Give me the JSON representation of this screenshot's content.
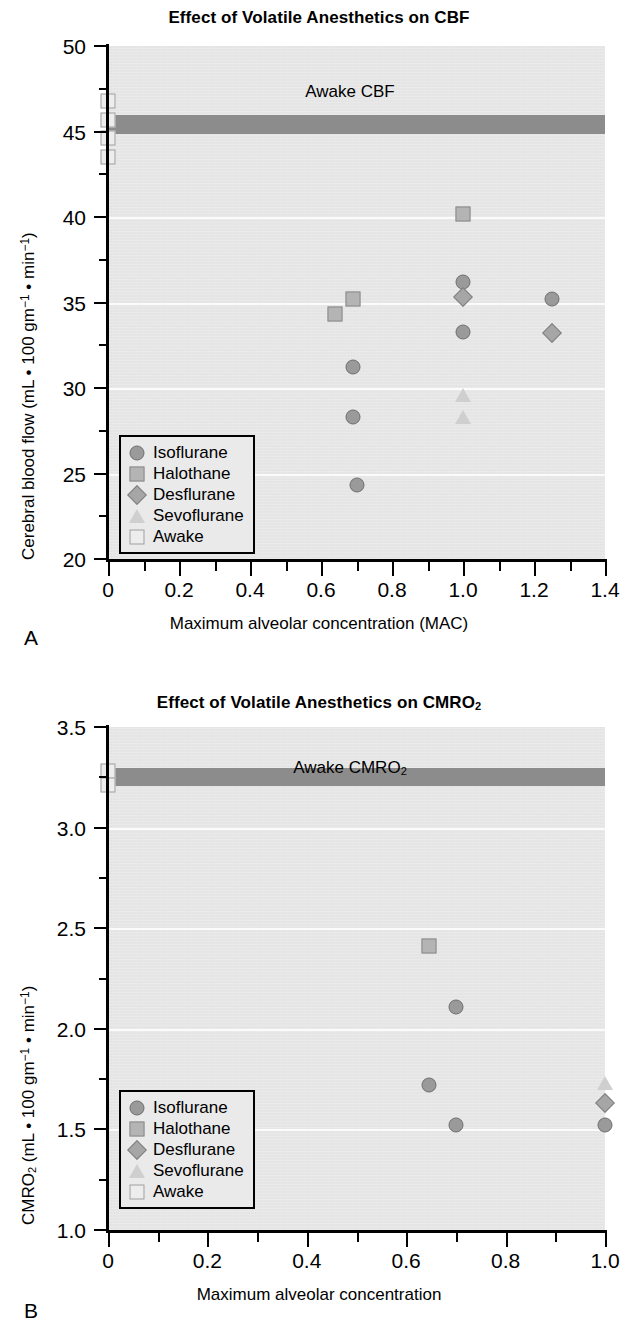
{
  "figure": {
    "panels": [
      {
        "letter": "A",
        "title_main": "Effect of Volatile Anesthetics on CBF",
        "title_plain": "Effect of Volatile Anesthetics on CBF",
        "band_label": "Awake CBF",
        "band_label_sub": ""
      },
      {
        "letter": "B",
        "title_main": "Effect of Volatile Anesthetics on CMRO",
        "title_sub": "2",
        "band_label": "Awake CMRO",
        "band_label_sub": "2"
      }
    ],
    "legend_items": [
      {
        "label": "Isoflurane",
        "symbol": "circle"
      },
      {
        "label": "Halothane",
        "symbol": "square"
      },
      {
        "label": "Desflurane",
        "symbol": "diamond"
      },
      {
        "label": "Sevoflurane",
        "symbol": "triangle"
      },
      {
        "label": "Awake",
        "symbol": "awake"
      }
    ],
    "colors": {
      "plot_background": "#e6e6e6",
      "awake_band": "#8c8c8c",
      "isoflurane": "#9a9a9a",
      "halothane": "#b4b4b4",
      "desflurane": "#a6a6a6",
      "sevoflurane": "#cfcfcf",
      "awake": "#ededed",
      "axis": "#000000",
      "gridline": "#fbfbfb"
    }
  },
  "chart_data": [
    {
      "type": "scatter",
      "panel": "A",
      "title": "Effect of Volatile Anesthetics on CBF",
      "xlabel": "Maximum alveolar concentration (MAC)",
      "ylabel": "Cerebral blood flow (mL • 100 gm⁻¹ • min⁻¹)",
      "ylabel_parts": {
        "lead": "Cerebral blood flow (mL • 100 gm",
        "sup1": "−1",
        "mid": " • min",
        "sup2": "−1",
        "tail": ")"
      },
      "xlim": [
        0,
        1.4
      ],
      "ylim": [
        20,
        50
      ],
      "xticks": [
        "0",
        "0.2",
        "0.4",
        "0.6",
        "0.8",
        "1.0",
        "1.2",
        "1.4"
      ],
      "xtick_values": [
        0,
        0.2,
        0.4,
        0.6,
        0.8,
        1.0,
        1.2,
        1.4
      ],
      "yticks": [
        "20",
        "25",
        "30",
        "35",
        "40",
        "45",
        "50"
      ],
      "ytick_values": [
        20,
        25,
        30,
        35,
        40,
        45,
        50
      ],
      "minor_ytick_values": [
        22.5,
        27.5,
        32.5,
        37.5,
        42.5,
        47.5
      ],
      "minor_xtick_values": [
        0.1,
        0.3,
        0.5,
        0.7,
        0.9,
        1.1,
        1.3
      ],
      "gridlines_y": [
        25,
        30,
        35,
        40,
        45
      ],
      "grid": true,
      "legend_position": "lower-left",
      "reference_band": {
        "label": "Awake CBF",
        "y_center": 45.4,
        "y_thickness": 1.1,
        "x_start": 0.0,
        "x_end": 1.4
      },
      "series": [
        {
          "name": "Isoflurane",
          "symbol": "circle",
          "points": [
            [
              0.69,
              31.2
            ],
            [
              0.69,
              28.3
            ],
            [
              0.7,
              24.3
            ],
            [
              1.0,
              36.2
            ],
            [
              1.0,
              33.3
            ],
            [
              1.25,
              35.2
            ]
          ]
        },
        {
          "name": "Halothane",
          "symbol": "square",
          "points": [
            [
              0.64,
              34.3
            ],
            [
              0.69,
              35.2
            ],
            [
              1.0,
              40.2
            ]
          ]
        },
        {
          "name": "Desflurane",
          "symbol": "diamond",
          "points": [
            [
              1.0,
              35.3
            ],
            [
              1.25,
              33.2
            ]
          ]
        },
        {
          "name": "Sevoflurane",
          "symbol": "triangle",
          "points": [
            [
              1.0,
              29.6
            ],
            [
              1.0,
              28.3
            ]
          ]
        },
        {
          "name": "Awake",
          "symbol": "awake",
          "points": [
            [
              0.0,
              46.8
            ],
            [
              0.0,
              45.7
            ],
            [
              0.0,
              44.6
            ],
            [
              0.0,
              43.5
            ]
          ]
        }
      ]
    },
    {
      "type": "scatter",
      "panel": "B",
      "title": "Effect of Volatile Anesthetics on CMRO2",
      "xlabel": "Maximum alveolar concentration",
      "ylabel": "CMRO2 (mL • 100 gm⁻¹ • min⁻¹)",
      "ylabel_parts": {
        "lead": "CMRO",
        "sub": "2",
        "mid1": " (mL • 100 gm",
        "sup1": "−1",
        "mid2": " • min",
        "sup2": "−1",
        "tail": ")"
      },
      "xlim": [
        0,
        1.0
      ],
      "ylim": [
        1.0,
        3.5
      ],
      "xticks": [
        "0",
        "0.2",
        "0.4",
        "0.6",
        "0.8",
        "1.0"
      ],
      "xtick_values": [
        0,
        0.2,
        0.4,
        0.6,
        0.8,
        1.0
      ],
      "yticks": [
        "1.0",
        "1.5",
        "2.0",
        "2.5",
        "3.0",
        "3.5"
      ],
      "ytick_values": [
        1.0,
        1.5,
        2.0,
        2.5,
        3.0,
        3.5
      ],
      "minor_ytick_values": [
        1.25,
        1.75,
        2.25,
        2.75,
        3.25
      ],
      "minor_xtick_values": [
        0.1,
        0.3,
        0.5,
        0.7,
        0.9
      ],
      "gridlines_y": [
        1.5,
        2.0,
        2.5,
        3.0
      ],
      "grid": true,
      "legend_position": "lower-left",
      "reference_band": {
        "label": "Awake CMRO2",
        "y_center": 3.25,
        "y_thickness": 0.09,
        "x_start": 0.0,
        "x_end": 1.0
      },
      "series": [
        {
          "name": "Isoflurane",
          "symbol": "circle",
          "points": [
            [
              0.645,
              1.72
            ],
            [
              0.7,
              2.11
            ],
            [
              0.7,
              1.52
            ],
            [
              1.0,
              1.52
            ]
          ]
        },
        {
          "name": "Halothane",
          "symbol": "square",
          "points": [
            [
              0.645,
              2.41
            ]
          ]
        },
        {
          "name": "Desflurane",
          "symbol": "diamond",
          "points": [
            [
              1.0,
              1.63
            ]
          ]
        },
        {
          "name": "Sevoflurane",
          "symbol": "triangle",
          "points": [
            [
              1.0,
              1.73
            ]
          ]
        },
        {
          "name": "Awake",
          "symbol": "awake",
          "points": [
            [
              0.0,
              3.28
            ],
            [
              0.0,
              3.21
            ]
          ]
        }
      ]
    }
  ]
}
